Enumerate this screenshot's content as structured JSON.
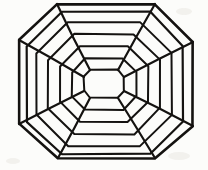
{
  "figure": {
    "background_color": "#fcfcfa",
    "ink_color": "#141210",
    "canvas": {
      "width": 208,
      "height": 170
    },
    "center": {
      "x": 104,
      "y": 84
    },
    "ring_count": 7,
    "spoke_count": 4,
    "spoke_positions": [
      "top-left",
      "top-right",
      "bottom-right",
      "bottom-left"
    ]
  },
  "chart_data": {
    "type": "diagram",
    "shape": "octagon-web",
    "grid": true,
    "legend": "none",
    "rings": [
      {
        "index": 0,
        "name": "core",
        "stroke_width": 2.0,
        "points": [
          [
            90,
            70
          ],
          [
            118,
            70
          ],
          [
            124,
            77
          ],
          [
            124,
            91
          ],
          [
            118,
            98
          ],
          [
            90,
            98
          ],
          [
            84,
            91
          ],
          [
            84,
            77
          ]
        ]
      },
      {
        "index": 1,
        "name": "ring-1",
        "stroke_width": 2.0,
        "points": [
          [
            85,
            58
          ],
          [
            123,
            58
          ],
          [
            136,
            72
          ],
          [
            136,
            96
          ],
          [
            123,
            110
          ],
          [
            85,
            110
          ],
          [
            72,
            96
          ],
          [
            72,
            72
          ]
        ]
      },
      {
        "index": 2,
        "name": "ring-2",
        "stroke_width": 2.0,
        "points": [
          [
            80,
            46
          ],
          [
            128,
            46
          ],
          [
            148,
            66
          ],
          [
            148,
            102
          ],
          [
            128,
            122
          ],
          [
            80,
            122
          ],
          [
            60,
            102
          ],
          [
            60,
            66
          ]
        ]
      },
      {
        "index": 3,
        "name": "ring-3",
        "stroke_width": 2.0,
        "points": [
          [
            74,
            34
          ],
          [
            134,
            34
          ],
          [
            160,
            60
          ],
          [
            160,
            108
          ],
          [
            134,
            134
          ],
          [
            74,
            134
          ],
          [
            48,
            108
          ],
          [
            48,
            60
          ]
        ]
      },
      {
        "index": 4,
        "name": "ring-4",
        "stroke_width": 2.0,
        "points": [
          [
            68,
            22
          ],
          [
            140,
            22
          ],
          [
            172,
            53
          ],
          [
            172,
            115
          ],
          [
            140,
            146
          ],
          [
            68,
            146
          ],
          [
            36,
            115
          ],
          [
            36,
            53
          ]
        ]
      },
      {
        "index": 5,
        "name": "ring-5",
        "stroke_width": 2.2,
        "points": [
          [
            62,
            12
          ],
          [
            150,
            12
          ],
          [
            183,
            46
          ],
          [
            183,
            122
          ],
          [
            150,
            154
          ],
          [
            62,
            154
          ],
          [
            27,
            122
          ],
          [
            27,
            46
          ]
        ]
      },
      {
        "index": 6,
        "name": "outer-boundary",
        "stroke_width": 2.6,
        "points": [
          [
            57,
            4
          ],
          [
            155,
            4
          ],
          [
            193,
            42
          ],
          [
            193,
            126
          ],
          [
            155,
            158
          ],
          [
            58,
            158
          ],
          [
            19,
            124
          ],
          [
            19,
            40
          ]
        ]
      }
    ],
    "spokes": [
      {
        "name": "spoke-top-left",
        "from": [
          84,
          77
        ],
        "to": [
          19,
          40
        ]
      },
      {
        "name": "spoke-top-right",
        "from": [
          124,
          77
        ],
        "to": [
          193,
          42
        ]
      },
      {
        "name": "spoke-bottom-right",
        "from": [
          124,
          91
        ],
        "to": [
          193,
          126
        ]
      },
      {
        "name": "spoke-bottom-left",
        "from": [
          84,
          91
        ],
        "to": [
          19,
          124
        ]
      }
    ],
    "corner_spoke_detail": [
      {
        "name": "corner-top-left-upper",
        "from": [
          90,
          70
        ],
        "to": [
          57,
          4
        ]
      },
      {
        "name": "corner-top-right-upper",
        "from": [
          118,
          70
        ],
        "to": [
          155,
          4
        ]
      },
      {
        "name": "corner-bottom-right-lower",
        "from": [
          118,
          98
        ],
        "to": [
          155,
          158
        ]
      },
      {
        "name": "corner-bottom-left-lower",
        "from": [
          90,
          98
        ],
        "to": [
          58,
          158
        ]
      }
    ]
  },
  "smudges": [
    {
      "name": "smudge-top-right",
      "x": 176,
      "y": 8,
      "w": 16,
      "h": 7
    },
    {
      "name": "smudge-bottom-right",
      "x": 168,
      "y": 152,
      "w": 22,
      "h": 8
    },
    {
      "name": "smudge-bottom-left",
      "x": 6,
      "y": 158,
      "w": 14,
      "h": 6
    }
  ]
}
